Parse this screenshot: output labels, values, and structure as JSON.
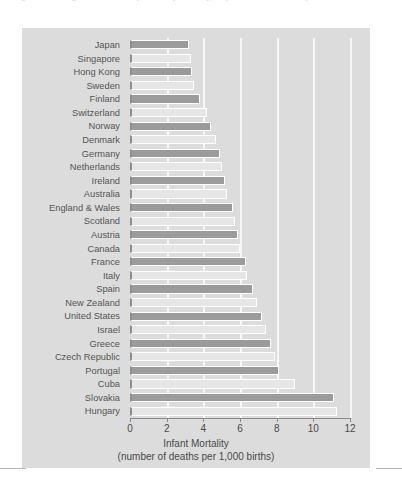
{
  "figure": {
    "top_cropped_text": "a figure showing infant mortality rates by country, expressed as deaths per 1,000 live births",
    "panel_color": "#dcdcdc",
    "gridline_color": "#f7f7f7",
    "bar_dark_color": "#9b9b9b",
    "bar_light_color": "#e6e6e6",
    "axis_color": "#8a8a8a",
    "text_color": "#4a4a4a"
  },
  "chart_data": {
    "type": "bar",
    "orientation": "horizontal",
    "title": "Infant Mortality",
    "subtitle": "(number of deaths per 1,000 births)",
    "xlabel": "Infant Mortality",
    "ylabel": "",
    "xlim": [
      0,
      12
    ],
    "xticks": [
      0,
      2,
      4,
      6,
      8,
      10,
      12
    ],
    "xticklabels": [
      "0",
      "2",
      "4",
      "6",
      "8",
      "10",
      "12"
    ],
    "grid": "vertical-white-gridlines",
    "legend": "none",
    "categories": [
      "Japan",
      "Singapore",
      "Hong Kong",
      "Sweden",
      "Finland",
      "Switzerland",
      "Norway",
      "Denmark",
      "Germany",
      "Netherlands",
      "Ireland",
      "Australia",
      "England & Wales",
      "Scotland",
      "Austria",
      "Canada",
      "France",
      "Italy",
      "Spain",
      "New Zealand",
      "United States",
      "Israel",
      "Greece",
      "Czech Republic",
      "Portugal",
      "Cuba",
      "Slovakia",
      "Hungary"
    ],
    "values": [
      3.2,
      3.3,
      3.4,
      3.5,
      3.8,
      4.2,
      4.3,
      4.5,
      4.7,
      5.0,
      5.2,
      5.3,
      5.5,
      5.6,
      5.8,
      5.9,
      6.2,
      6.3,
      6.6,
      6.9,
      7.2,
      7.4,
      7.7,
      7.9,
      8.1,
      9.0,
      11.1,
      11.3
    ]
  },
  "bars": [
    {
      "country": "Japan",
      "value": 3.2,
      "shade": "dark"
    },
    {
      "country": "Singapore",
      "value": 3.3,
      "shade": "light"
    },
    {
      "country": "Hong Kong",
      "value": 3.4,
      "shade": "dark"
    },
    {
      "country": "Sweden",
      "value": 3.5,
      "shade": "light"
    },
    {
      "country": "Finland",
      "value": 3.8,
      "shade": "dark"
    },
    {
      "country": "Switzerland",
      "value": 4.2,
      "shade": "light"
    },
    {
      "country": "Norway",
      "value": 4.4,
      "shade": "dark"
    },
    {
      "country": "Denmark",
      "value": 4.7,
      "shade": "light"
    },
    {
      "country": "Germany",
      "value": 4.9,
      "shade": "dark"
    },
    {
      "country": "Netherlands",
      "value": 5.0,
      "shade": "light"
    },
    {
      "country": "Ireland",
      "value": 5.2,
      "shade": "dark"
    },
    {
      "country": "Australia",
      "value": 5.3,
      "shade": "light"
    },
    {
      "country": "England & Wales",
      "value": 5.6,
      "shade": "dark"
    },
    {
      "country": "Scotland",
      "value": 5.7,
      "shade": "light"
    },
    {
      "country": "Austria",
      "value": 5.9,
      "shade": "dark"
    },
    {
      "country": "Canada",
      "value": 6.0,
      "shade": "light"
    },
    {
      "country": "France",
      "value": 6.3,
      "shade": "dark"
    },
    {
      "country": "Italy",
      "value": 6.4,
      "shade": "light"
    },
    {
      "country": "Spain",
      "value": 6.7,
      "shade": "dark"
    },
    {
      "country": "New Zealand",
      "value": 6.9,
      "shade": "light"
    },
    {
      "country": "United States",
      "value": 7.2,
      "shade": "dark"
    },
    {
      "country": "Israel",
      "value": 7.4,
      "shade": "light"
    },
    {
      "country": "Greece",
      "value": 7.7,
      "shade": "dark"
    },
    {
      "country": "Czech Republic",
      "value": 7.9,
      "shade": "light"
    },
    {
      "country": "Portugal",
      "value": 8.1,
      "shade": "dark"
    },
    {
      "country": "Cuba",
      "value": 9.0,
      "shade": "light"
    },
    {
      "country": "Slovakia",
      "value": 11.1,
      "shade": "dark"
    },
    {
      "country": "Hungary",
      "value": 11.3,
      "shade": "light"
    }
  ]
}
